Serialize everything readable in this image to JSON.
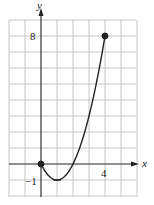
{
  "chart_data": {
    "type": "line",
    "title": "",
    "xlabel": "x",
    "ylabel": "y",
    "function": "y = x^2 - 2x",
    "domain": [
      0,
      4
    ],
    "x": [
      0,
      0.5,
      1,
      1.5,
      2,
      2.5,
      3,
      3.5,
      4
    ],
    "y": [
      0,
      -0.75,
      -1,
      -0.75,
      0,
      1.25,
      3,
      5.25,
      8
    ],
    "endpoints": [
      {
        "x": 0,
        "y": 0,
        "filled": true
      },
      {
        "x": 4,
        "y": 8,
        "filled": true
      }
    ],
    "vertex": {
      "x": 1,
      "y": -1
    },
    "xlim": [
      -2,
      6
    ],
    "ylim": [
      -2,
      9
    ],
    "grid": true,
    "grid_step": 1,
    "tick_labels": {
      "x": [
        "4"
      ],
      "y": [
        "8",
        "-1"
      ]
    },
    "colors": {
      "curve": "#222222",
      "grid": "#b8b8b8",
      "axis": "#222222"
    }
  },
  "labels": {
    "x_axis": "x",
    "y_axis": "y",
    "x_tick_4": "4",
    "y_tick_8": "8",
    "y_tick_neg1": "−1"
  }
}
